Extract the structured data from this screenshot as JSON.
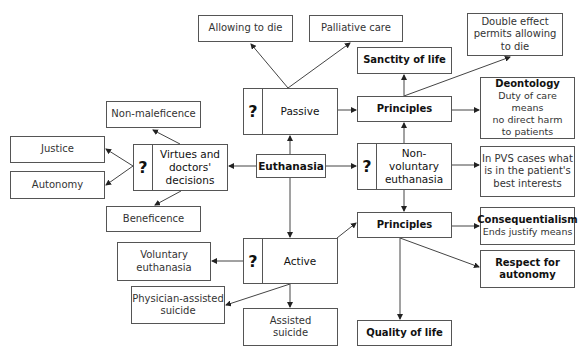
{
  "diagram": {
    "center": "Euthanasia",
    "question_mark": "?",
    "nodes": {
      "allowing_to_die": "Allowing to die",
      "palliative_care": "Palliative care",
      "double_effect": "Double effect\npermits allowing\nto die",
      "sanctity_of_life": "Sanctity of life",
      "passive": "Passive",
      "principles_top": "Principles",
      "deontology_title": "Deontology",
      "deontology_text": "Duty of care means\nno direct harm\nto patients",
      "non_maleficence": "Non-maleficence",
      "justice": "Justice",
      "autonomy": "Autonomy",
      "virtues": "Virtues and\ndoctors'\ndecisions",
      "beneficence": "Beneficence",
      "non_voluntary": "Non-voluntary\neuthanasia",
      "pvs": "In PVS cases what\nis in the patient's\nbest interests",
      "principles_bottom": "Principles",
      "consequentialism_title": "Consequentialism",
      "consequentialism_text": "Ends justify means",
      "respect_autonomy": "Respect for\nautonomy",
      "active": "Active",
      "voluntary": "Voluntary\neuthanasia",
      "physician_assisted": "Physician-assisted\nsuicide",
      "assisted_suicide": "Assisted\nsuicide",
      "quality_of_life": "Quality of life"
    }
  }
}
